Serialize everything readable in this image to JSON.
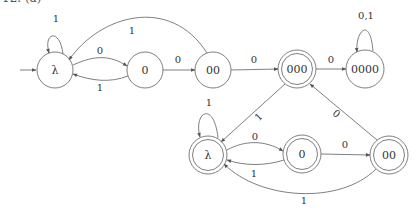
{
  "header": {
    "clipped_label": "12. (a)"
  },
  "colors": {
    "stroke": "#707070",
    "text": "#333333",
    "background": "#ffffff"
  },
  "automaton_top": {
    "states": [
      {
        "id": "t_lambda",
        "label": "λ",
        "accepting": false,
        "initial": true
      },
      {
        "id": "t_0",
        "label": "0",
        "accepting": false
      },
      {
        "id": "t_00",
        "label": "00",
        "accepting": false
      },
      {
        "id": "t_000",
        "label": "000",
        "accepting": true
      },
      {
        "id": "t_0000",
        "label": "0000",
        "accepting": false
      }
    ],
    "edges": [
      {
        "from": "λ",
        "to": "λ",
        "label": "1"
      },
      {
        "from": "λ",
        "to": "0",
        "label": "0"
      },
      {
        "from": "0",
        "to": "λ",
        "label": "1"
      },
      {
        "from": "00",
        "to": "λ",
        "label": "1"
      },
      {
        "from": "0",
        "to": "00",
        "label": "0"
      },
      {
        "from": "00",
        "to": "000",
        "label": "0"
      },
      {
        "from": "000",
        "to": "0000",
        "label": "0"
      },
      {
        "from": "0000",
        "to": "0000",
        "label": "0,1"
      }
    ]
  },
  "automaton_bottom": {
    "states": [
      {
        "id": "b_lambda",
        "label": "λ",
        "accepting": true
      },
      {
        "id": "b_0",
        "label": "0",
        "accepting": true
      },
      {
        "id": "b_00",
        "label": "00",
        "accepting": true
      }
    ],
    "edges": [
      {
        "from": "000",
        "to": "λ",
        "label": "1"
      },
      {
        "from": "00",
        "to": "000",
        "label": "0"
      },
      {
        "from": "λ",
        "to": "λ",
        "label": "1"
      },
      {
        "from": "λ",
        "to": "0",
        "label": "0"
      },
      {
        "from": "0",
        "to": "λ",
        "label": "1"
      },
      {
        "from": "0",
        "to": "00",
        "label": "0"
      },
      {
        "from": "00",
        "to": "λ",
        "label": "1"
      }
    ]
  }
}
